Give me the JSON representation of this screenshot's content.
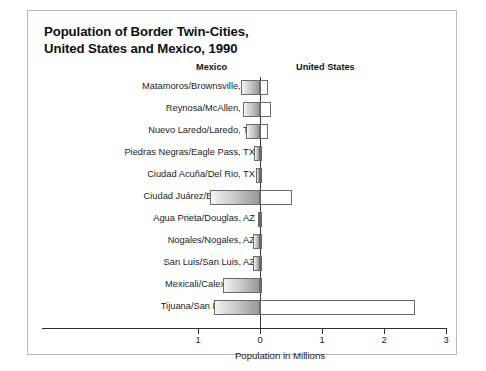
{
  "figure": {
    "title_line1": "Population of Border Twin-Cities,",
    "title_line2": "United States and Mexico, 1990",
    "header_mexico": "Mexico",
    "header_united_states": "United States"
  },
  "chart_data": {
    "type": "bar",
    "orientation": "horizontal",
    "style": "diverging-bidirectional",
    "title": "Population of Border Twin-Cities, United States and Mexico, 1990",
    "xlabel": "Population in Millions",
    "ylabel": "",
    "grid": false,
    "legend_position": "top-inline-headers",
    "axis_ticks": [
      "1",
      "0",
      "1",
      "2",
      "3"
    ],
    "axis_tick_values": [
      -1,
      0,
      1,
      2,
      3
    ],
    "xlim": [
      -1,
      3
    ],
    "categories": [
      "Matamoros/Brownsville, TX",
      "Reynosa/McAllen, TX",
      "Nuevo Laredo/Laredo, TX",
      "Piedras Negras/Eagle Pass, TX",
      "Ciudad Acuña/Del Rio, TX",
      "Ciudad Juárez/El Paso, TX",
      "Agua Prieta/Douglas, AZ",
      "Nogales/Nogales, AZ",
      "San Luis/San Luis, AZ",
      "Mexicali/Calexico, CA",
      "Tijuana/San Diego, CA"
    ],
    "series": [
      {
        "name": "Mexico",
        "direction": "left",
        "values": [
          0.3,
          0.28,
          0.22,
          0.1,
          0.06,
          0.8,
          0.04,
          0.11,
          0.12,
          0.6,
          0.75
        ]
      },
      {
        "name": "United States",
        "direction": "right",
        "values": [
          0.13,
          0.18,
          0.13,
          0.02,
          0.03,
          0.52,
          0.02,
          0.02,
          0.02,
          0.03,
          2.5
        ]
      }
    ]
  }
}
